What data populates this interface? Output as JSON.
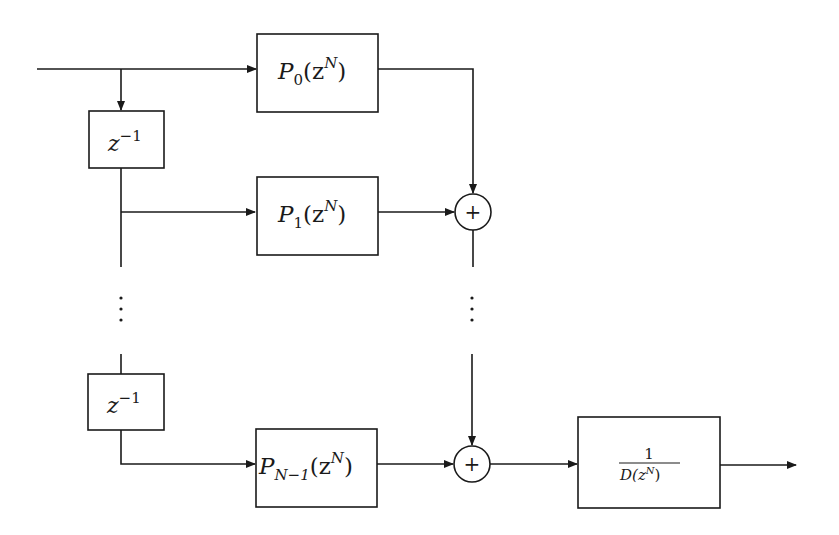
{
  "diagram": {
    "type": "block-diagram",
    "blocks": {
      "p0": {
        "base": "P",
        "sub": "0",
        "arg": "(z",
        "sup": "N",
        "close": ")"
      },
      "p1": {
        "base": "P",
        "sub": "1",
        "arg": "(z",
        "sup": "N",
        "close": ")"
      },
      "pn1": {
        "base": "P",
        "sub": "N−1",
        "arg": "(z",
        "sup": "N",
        "close": ")"
      },
      "delay_top": {
        "base": "z",
        "sup": "−1"
      },
      "delay_bottom": {
        "base": "z",
        "sup": "−1"
      },
      "recursive": {
        "numerator": "1",
        "denominator_base": "D(z",
        "denominator_sup": "N",
        "denominator_close": ")"
      }
    },
    "summers": {
      "top": {
        "symbol": "+"
      },
      "bottom": {
        "symbol": "+"
      }
    },
    "ellipsis": "⋮",
    "colors": {
      "stroke": "#1a1a1a",
      "background": "#ffffff"
    }
  }
}
